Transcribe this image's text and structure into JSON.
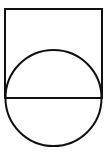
{
  "canvas": {
    "width": 107,
    "height": 153,
    "background_color": "#ffffff",
    "stroke_color": "#111111",
    "stroke_width": 2
  },
  "figure": {
    "shapes": [
      {
        "id": "square",
        "name": "square-outline",
        "type": "rectangle",
        "x": 5,
        "y": 9,
        "width": 97,
        "height": 89,
        "fill": "none",
        "stroke": "#111111",
        "stroke_width": 2
      },
      {
        "id": "circle",
        "name": "circle-outline",
        "type": "circle",
        "cx": 53.5,
        "cy": 98,
        "r": 48,
        "fill": "none",
        "stroke": "#111111",
        "stroke_width": 2
      },
      {
        "id": "diameter-line",
        "name": "horizontal-diameter-line",
        "type": "line",
        "x1": 5,
        "y1": 98,
        "x2": 102,
        "y2": 98,
        "stroke": "#111111",
        "stroke_width": 2
      }
    ]
  }
}
